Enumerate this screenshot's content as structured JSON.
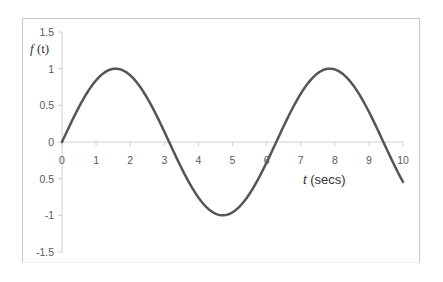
{
  "chart_data": {
    "type": "line",
    "title": "",
    "xlabel": "t (secs)",
    "ylabel": "f (t)",
    "xlim": [
      0,
      10
    ],
    "ylim": [
      -1.5,
      1.5
    ],
    "x_ticks": [
      "0",
      "1",
      "2",
      "3",
      "4",
      "5",
      "6",
      "7",
      "8",
      "9",
      "10"
    ],
    "y_ticks": [
      "1.5",
      "1",
      "0.5",
      "0",
      "0.5",
      "-1",
      "-1.5"
    ],
    "y_tick_values": [
      1.5,
      1,
      0.5,
      0,
      -0.5,
      -1,
      -1.5
    ],
    "grid": false,
    "legend": null,
    "series": [
      {
        "name": "f(t) = sin(t)",
        "color": "#555555",
        "x": [
          0,
          0.5,
          1,
          1.5,
          1.5708,
          2,
          2.5,
          3,
          3.1416,
          3.5,
          4,
          4.5,
          4.7124,
          5,
          5.5,
          6,
          6.2832,
          6.5,
          7,
          7.5,
          7.854,
          8,
          8.5,
          9,
          9.4248,
          9.5,
          10
        ],
        "values": [
          0,
          0.479,
          0.841,
          0.997,
          1.0,
          0.909,
          0.598,
          0.141,
          0.0,
          -0.351,
          -0.757,
          -0.978,
          -1.0,
          -0.959,
          -0.706,
          -0.279,
          0.0,
          0.215,
          0.657,
          0.938,
          1.0,
          0.989,
          0.798,
          0.412,
          0.0,
          -0.075,
          -0.544
        ]
      }
    ]
  },
  "axis_labels": {
    "y_label_italic": "f",
    "y_label_rest": " (t)",
    "x_label_italic": "t",
    "x_label_rest": " (secs)"
  },
  "colors": {
    "line": "#555555",
    "axis": "#d0d0d0",
    "tick_text": "#595959",
    "frame": "#c8c8c8"
  }
}
